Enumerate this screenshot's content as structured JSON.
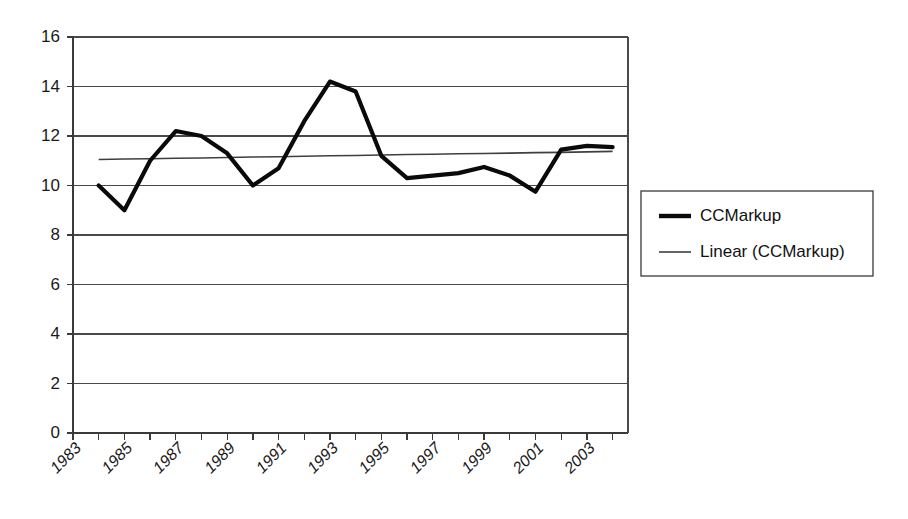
{
  "chart_data": {
    "type": "line",
    "title": "",
    "xlabel": "",
    "ylabel": "",
    "xlim": [
      1983,
      2004.6
    ],
    "ylim": [
      0,
      16
    ],
    "ytick_step": 2,
    "grid": true,
    "grid_axis": "y",
    "legend_position": "right-outside",
    "x": [
      1984,
      1985,
      1986,
      1987,
      1988,
      1989,
      1990,
      1991,
      1992,
      1993,
      1994,
      1995,
      1996,
      1997,
      1998,
      1999,
      2000,
      2001,
      2002,
      2003,
      2004
    ],
    "yticks": [
      0,
      2,
      4,
      6,
      8,
      10,
      12,
      14,
      16
    ],
    "ytick_labels": [
      "0",
      "2",
      "4",
      "6",
      "8",
      "10",
      "12",
      "14",
      "16"
    ],
    "xticks": [
      1983,
      1985,
      1987,
      1989,
      1991,
      1993,
      1995,
      1997,
      1999,
      2001,
      2003
    ],
    "xtick_labels": [
      "1983",
      "1985",
      "1987",
      "1989",
      "1991",
      "1993",
      "1995",
      "1997",
      "1999",
      "2001",
      "2003"
    ],
    "xtick_minor": [
      1984,
      1986,
      1988,
      1990,
      1992,
      1994,
      1996,
      1998,
      2000,
      2002,
      2004
    ],
    "series": [
      {
        "name": "CCMarkup",
        "style": "thick-black-line",
        "color": "#0a0a0a",
        "values": [
          10.0,
          9.0,
          11.0,
          12.2,
          12.0,
          11.3,
          10.0,
          10.7,
          12.6,
          14.2,
          13.8,
          11.2,
          10.3,
          10.4,
          10.5,
          10.75,
          10.4,
          9.75,
          11.45,
          11.6,
          11.55
        ]
      },
      {
        "name": "Linear (CCMarkup)",
        "style": "thin-gray-trendline",
        "color": "#3f3f3f",
        "trend_start": 11.05,
        "trend_end": 11.38,
        "values": [
          11.05,
          11.07,
          11.08,
          11.1,
          11.11,
          11.13,
          11.15,
          11.16,
          11.18,
          11.2,
          11.21,
          11.23,
          11.25,
          11.26,
          11.28,
          11.29,
          11.31,
          11.33,
          11.34,
          11.36,
          11.38
        ]
      }
    ]
  },
  "legend": {
    "items": [
      {
        "label": "CCMarkup",
        "swatch": "thick-line-swatch"
      },
      {
        "label": "Linear (CCMarkup)",
        "swatch": "thin-line-swatch"
      }
    ]
  },
  "colors": {
    "background": "#ffffff",
    "axis": "#3a3a3a",
    "grid": "#4a4a4a",
    "series_main": "#0a0a0a",
    "series_trend": "#3f3f3f",
    "text": "#1a1a1a"
  }
}
